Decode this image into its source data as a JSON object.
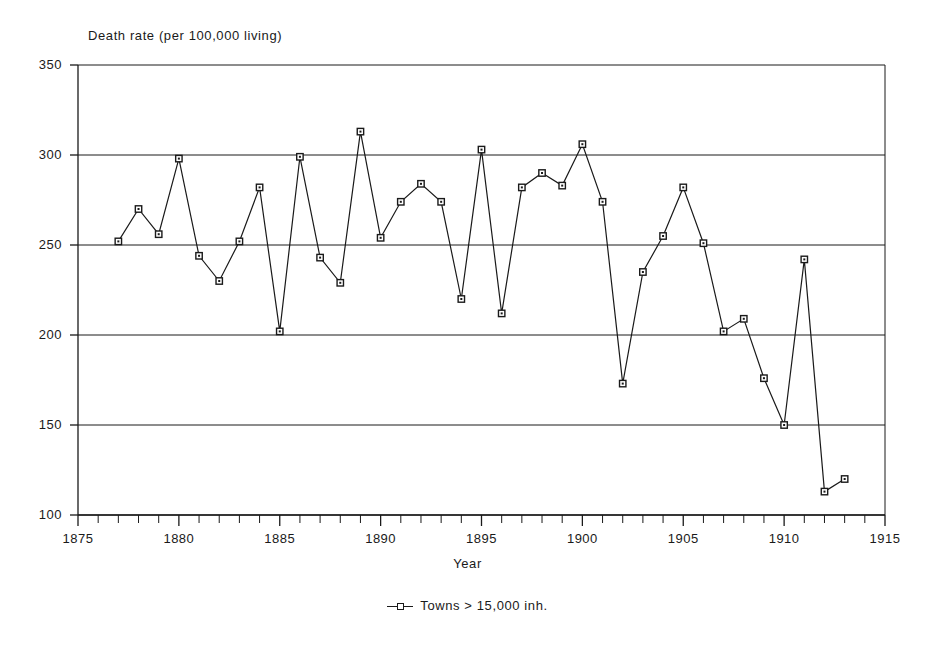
{
  "chart_data": {
    "type": "line",
    "title": "",
    "xlabel": "Year",
    "ylabel": "Death rate (per 100,000 living)",
    "xlim": [
      1875,
      1915
    ],
    "ylim": [
      100,
      350
    ],
    "yticks": [
      100,
      150,
      200,
      250,
      300,
      350
    ],
    "xticks": [
      1875,
      1880,
      1885,
      1890,
      1895,
      1900,
      1905,
      1910,
      1915
    ],
    "x_minor_tick_step": 1,
    "grid": "horizontal",
    "legend_position": "below-plot-centered",
    "marker": "open-square",
    "line_color": "#1a1a1a",
    "series": [
      {
        "name": "Towns > 15,000 inh.",
        "x": [
          1877,
          1878,
          1879,
          1880,
          1881,
          1882,
          1883,
          1884,
          1885,
          1886,
          1887,
          1888,
          1889,
          1890,
          1891,
          1892,
          1893,
          1894,
          1895,
          1896,
          1897,
          1898,
          1899,
          1900,
          1901,
          1902,
          1903,
          1904,
          1905,
          1906,
          1907,
          1908,
          1909,
          1910,
          1911,
          1912,
          1913
        ],
        "values": [
          252,
          270,
          256,
          298,
          244,
          230,
          252,
          282,
          202,
          299,
          243,
          229,
          313,
          254,
          274,
          284,
          274,
          220,
          303,
          212,
          282,
          290,
          283,
          306,
          274,
          173,
          235,
          255,
          282,
          251,
          202,
          209,
          176,
          150,
          242,
          113,
          120
        ]
      }
    ]
  },
  "legend": {
    "entries": [
      {
        "label": "Towns > 15,000 inh."
      }
    ]
  },
  "axes": {
    "y_title": "Death rate (per 100,000 living)",
    "x_title": "Year",
    "y_tick_labels": [
      "350",
      "300",
      "250",
      "200",
      "150",
      "100"
    ],
    "x_tick_labels": [
      "1875",
      "1880",
      "1885",
      "1890",
      "1895",
      "1900",
      "1905",
      "1910",
      "1915"
    ]
  }
}
